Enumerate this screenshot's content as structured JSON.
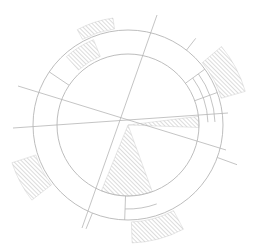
{
  "diagram": {
    "type": "circular-sector-diagram",
    "center": [
      128,
      125
    ],
    "colors": {
      "stroke": "#b5b5b5",
      "hatch": "#a8a8a8",
      "background": "#ffffff"
    },
    "rings": [
      {
        "name": "inner-circle",
        "r": 71
      },
      {
        "name": "outer-circle",
        "r": 95
      }
    ],
    "lines": [
      {
        "name": "line-upper-left-diagonal",
        "x1": 18,
        "y1": 86,
        "x2": 226,
        "y2": 150
      },
      {
        "name": "line-near-horizontal",
        "x1": 13,
        "y1": 128,
        "x2": 228,
        "y2": 113
      },
      {
        "name": "line-steep-diagonal",
        "x1": 157,
        "y1": 15,
        "x2": 82,
        "y2": 228
      }
    ],
    "hatched_regions": [
      {
        "name": "hatch-top-outer",
        "r1": 97,
        "r2": 108,
        "a1": -118,
        "a2": -98
      },
      {
        "name": "hatch-upper-left-ring",
        "r1": 74,
        "r2": 92,
        "a1": -132,
        "a2": -112
      },
      {
        "name": "hatch-right-outer",
        "r1": 97,
        "r2": 122,
        "a1": -40,
        "a2": -16
      },
      {
        "name": "hatch-left-outer",
        "r1": 97,
        "r2": 122,
        "a1": 142,
        "a2": 162
      },
      {
        "name": "hatch-bottom-outer",
        "r1": 97,
        "r2": 118,
        "a1": 62,
        "a2": 88
      },
      {
        "name": "hatch-center-sector",
        "r1": 0,
        "r2": 71,
        "a1": 70,
        "a2": 112
      },
      {
        "name": "hatch-right-sliver",
        "r1": 0,
        "r2": 71,
        "a1": -7,
        "a2": 2
      }
    ],
    "segments": [
      {
        "name": "ring-band-right-1",
        "r1": 71,
        "r2": 95,
        "a": -36
      },
      {
        "name": "ring-band-right-2",
        "r1": 71,
        "r2": 95,
        "a": -20
      },
      {
        "name": "ring-band-upper-left",
        "r1": 71,
        "r2": 95,
        "a": -146
      },
      {
        "name": "ring-band-bottom",
        "r1": 71,
        "r2": 95,
        "a": 92
      }
    ],
    "extra_arcs": [
      {
        "name": "arc-right-inner-1",
        "r": 80,
        "a1": -36,
        "a2": -2
      },
      {
        "name": "arc-right-inner-2",
        "r": 87,
        "a1": -36,
        "a2": -2
      },
      {
        "name": "arc-bottom-inner",
        "r": 84,
        "a1": 70,
        "a2": 92
      }
    ],
    "ticks": [
      {
        "name": "tick-top-right",
        "a": -52,
        "r1": 95,
        "r2": 110
      },
      {
        "name": "tick-right-lower",
        "a": 20,
        "r1": 95,
        "r2": 116
      },
      {
        "name": "tick-bottom-left",
        "a": 112,
        "r1": 95,
        "r2": 112
      }
    ]
  }
}
